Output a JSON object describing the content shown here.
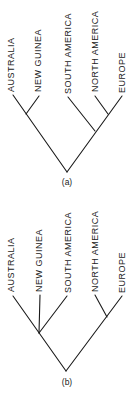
{
  "diagram": {
    "type": "phylogenetic-trees",
    "panels": [
      {
        "id": "a",
        "label": "(a)",
        "taxa": [
          "AUSTRALIA",
          "NEW GUINEA",
          "SOUTH AMERICA",
          "NORTH AMERICA",
          "EUROPE"
        ],
        "topology": "((AUSTRALIA, NEW GUINEA), (SOUTH AMERICA, (NORTH AMERICA, EUROPE)))"
      },
      {
        "id": "b",
        "label": "(b)",
        "taxa": [
          "AUSTRALIA",
          "NEW GUINEA",
          "SOUTH AMERICA",
          "NORTH AMERICA",
          "EUROPE"
        ],
        "topology": "((AUSTRALIA, NEW GUINEA, SOUTH AMERICA), (NORTH AMERICA, EUROPE))"
      }
    ]
  }
}
